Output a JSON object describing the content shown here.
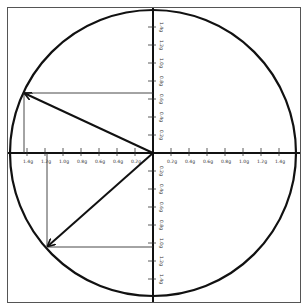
{
  "diagram": {
    "type": "g-g diagram (friction circle)",
    "unit": "g",
    "center": {
      "x": 153,
      "y": 153
    },
    "radius_px": 143,
    "px_per_g": 90,
    "colors": {
      "stroke": "#111111",
      "frame": "#555555",
      "projection": "#333333",
      "background": "#ffffff"
    },
    "x_axis": {
      "left_labels": [
        "1.4g",
        "1.2g",
        "1.0g",
        "0.8g",
        "0.6g",
        "0.4g",
        "0.2g"
      ],
      "right_labels": [
        "0.2g",
        "0.4g",
        "0.6g",
        "0.8g",
        "1.0g",
        "1.2g",
        "1.4g"
      ]
    },
    "y_axis": {
      "top_labels": [
        "1.4g",
        "1.2g",
        "1.0g",
        "0.8g",
        "0.6g",
        "0.4g",
        "0.2g"
      ],
      "bottom_labels": [
        "0.2g",
        "0.4g",
        "0.6g",
        "0.8g",
        "1.0g",
        "1.2g",
        "1.4g"
      ]
    },
    "vectors": [
      {
        "name": "upper-left-vector",
        "x_g": -1.43,
        "y_g": 0.67,
        "tip": {
          "x": 24,
          "y": 93
        }
      },
      {
        "name": "lower-left-vector",
        "x_g": -1.18,
        "y_g": -1.04,
        "tip": {
          "x": 47,
          "y": 247
        }
      }
    ]
  }
}
